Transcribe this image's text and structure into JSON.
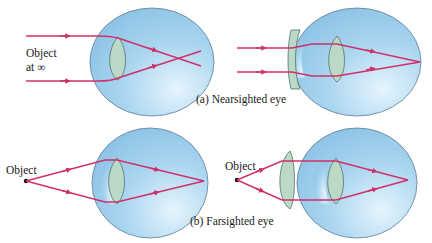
{
  "figure": {
    "colors": {
      "ray": "#d0306a",
      "eye_fill": "#a6d3ef",
      "eye_stroke": "#5d7f94",
      "lens_fill": "#bcd8c7",
      "lens_stroke": "#4f7466",
      "background": "#ffffff"
    },
    "panel_a": {
      "caption": "(a) Nearsighted eye",
      "object_label_line1": "Object",
      "object_label_line2": "at ∞",
      "corrective_lens": "diverging (concave)"
    },
    "panel_b": {
      "caption": "(b) Farsighted eye",
      "object_label_left": "Object",
      "object_label_right": "Object",
      "corrective_lens": "converging (convex)"
    }
  }
}
